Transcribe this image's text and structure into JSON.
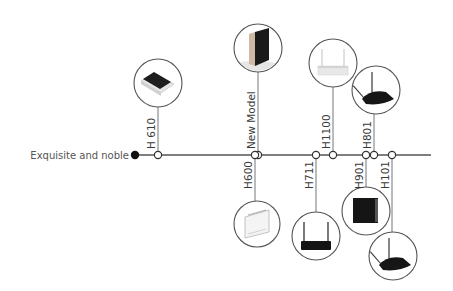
{
  "timeline": {
    "start_label": "Exquisite and noble",
    "line_color": "#555555",
    "line": {
      "x1": 135,
      "x2": 431,
      "y": 155
    },
    "start_dot": {
      "x": 135,
      "r": 4.2,
      "color": "#111111"
    },
    "items": [
      {
        "id": "h610",
        "label": "H 610",
        "side": "top",
        "node_x": 158,
        "circle": {
          "cx": 158,
          "cy": 83,
          "r": 24
        },
        "product": "flat-box"
      },
      {
        "id": "new-model",
        "label": "New Model",
        "side": "top",
        "node_x": 258,
        "circle": {
          "cx": 258,
          "cy": 48,
          "r": 24
        },
        "product": "vertical-box"
      },
      {
        "id": "h600",
        "label": "H600",
        "side": "bottom",
        "node_x": 255,
        "circle": {
          "cx": 257,
          "cy": 224,
          "r": 23
        },
        "product": "white-box"
      },
      {
        "id": "h711",
        "label": "H711",
        "side": "bottom",
        "node_x": 316,
        "circle": {
          "cx": 316,
          "cy": 236,
          "r": 24
        },
        "product": "dual-antenna-router"
      },
      {
        "id": "h1100",
        "label": "H1100",
        "side": "top",
        "node_x": 333,
        "circle": {
          "cx": 333,
          "cy": 63,
          "r": 24
        },
        "product": "white-antenna-router"
      },
      {
        "id": "h901",
        "label": "H901",
        "side": "bottom",
        "node_x": 366,
        "circle": {
          "cx": 366,
          "cy": 211,
          "r": 24
        },
        "product": "black-square-box"
      },
      {
        "id": "h801",
        "label": "H801",
        "side": "top",
        "node_x": 374,
        "circle": {
          "cx": 376,
          "cy": 90,
          "r": 24
        },
        "product": "angled-antenna-router"
      },
      {
        "id": "h101",
        "label": "H101",
        "side": "bottom",
        "node_x": 392,
        "circle": {
          "cx": 393,
          "cy": 256,
          "r": 24
        },
        "product": "angled-antenna-router"
      }
    ]
  }
}
